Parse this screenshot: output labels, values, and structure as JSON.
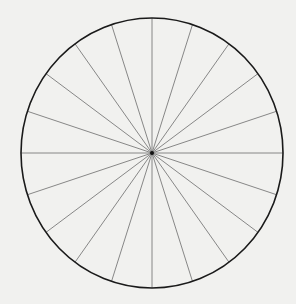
{
  "diagram": {
    "type": "radial-division-wheel",
    "background_color": "#f1f1ef",
    "circle": {
      "cx": 152,
      "cy": 153,
      "rx": 131,
      "ry": 135,
      "stroke": "#1a1a1a",
      "stroke_width": 1.6
    },
    "spokes": {
      "count": 20,
      "angle_step_deg": 18,
      "start_angle_deg": 0,
      "stroke": "#7a7a7a",
      "stroke_width": 0.9
    },
    "center_dot": {
      "radius": 2,
      "fill": "#111111"
    }
  }
}
